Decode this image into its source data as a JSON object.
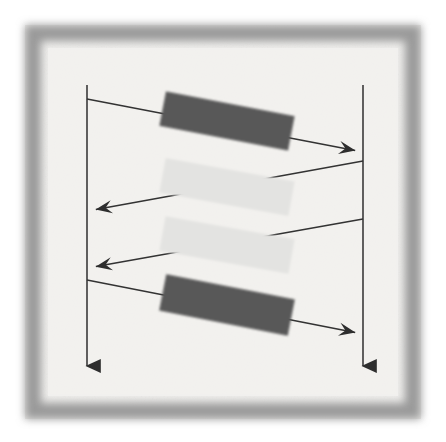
{
  "figure": {
    "kind": "uml-sequence-diagram",
    "title": "",
    "caption": "",
    "canvas": {
      "width": 446,
      "height": 442,
      "background": "#ffffff"
    },
    "frame": {
      "name": "photocopy-border",
      "x": 25,
      "y": 25,
      "width": 396,
      "height": 394,
      "thickness": 16,
      "color": "#9a9a9a",
      "blur": 7,
      "inner_fill": "#f0efed",
      "inner_texture": true
    },
    "palette": {
      "line": "#333333",
      "lifeline": "#3a3a3a",
      "bar_dark": "#585858",
      "bar_light": "#e3e3e1",
      "paper": "#f0efed",
      "page": "#ffffff"
    }
  },
  "chart_data": {
    "type": "diagram",
    "title": "",
    "xlabel": "",
    "ylabel": "",
    "lifelines": [
      {
        "id": "lifeline-left",
        "label": "",
        "x": 87,
        "y_top": 85,
        "y_bottom": 378,
        "arrowhead": "filled-triangle",
        "color": "#3a3a3a",
        "width": 1.6
      },
      {
        "id": "lifeline-right",
        "label": "",
        "x": 363,
        "y_top": 85,
        "y_bottom": 378,
        "arrowhead": "filled-triangle",
        "color": "#3a3a3a",
        "width": 1.6
      }
    ],
    "messages": [
      {
        "id": "message-1",
        "label": "",
        "direction": "left-to-right",
        "from": "lifeline-left",
        "to": "lifeline-right",
        "x1": 87,
        "y1": 99,
        "x2": 363,
        "y2": 152,
        "arrowhead": "open-line",
        "color": "#333333"
      },
      {
        "id": "message-2",
        "label": "",
        "direction": "right-to-left",
        "from": "lifeline-right",
        "to": "lifeline-left",
        "x1": 363,
        "y1": 161,
        "x2": 88,
        "y2": 211,
        "arrowhead": "open-line",
        "color": "#333333"
      },
      {
        "id": "message-3",
        "label": "",
        "direction": "right-to-left",
        "from": "lifeline-right",
        "to": "lifeline-left",
        "x1": 363,
        "y1": 219,
        "x2": 88,
        "y2": 268,
        "arrowhead": "open-line",
        "color": "#333333"
      },
      {
        "id": "message-4",
        "label": "",
        "direction": "left-to-right",
        "from": "lifeline-left",
        "to": "lifeline-right",
        "x1": 87,
        "y1": 280,
        "x2": 363,
        "y2": 334,
        "arrowhead": "open-line",
        "color": "#333333"
      }
    ],
    "label_bars": [
      {
        "id": "label-bar-1",
        "text": "",
        "obscured": true,
        "shade": "dark",
        "fill": "#585858",
        "cx": 227,
        "cy": 121,
        "width": 131,
        "height": 35,
        "rotation_deg": 10.9,
        "on_message": "message-1"
      },
      {
        "id": "label-bar-2",
        "text": "",
        "obscured": true,
        "shade": "light",
        "fill": "#e3e3e1",
        "cx": 227,
        "cy": 187,
        "width": 131,
        "height": 35,
        "rotation_deg": 10.3,
        "on_message": "message-2"
      },
      {
        "id": "label-bar-3",
        "text": "",
        "obscured": true,
        "shade": "light",
        "fill": "#e3e3e1",
        "cx": 227,
        "cy": 245,
        "width": 131,
        "height": 35,
        "rotation_deg": 10.1,
        "on_message": "message-3"
      },
      {
        "id": "label-bar-4",
        "text": "",
        "obscured": true,
        "shade": "dark",
        "fill": "#585858",
        "cx": 227,
        "cy": 305,
        "width": 131,
        "height": 37,
        "rotation_deg": 11.1,
        "on_message": "message-4"
      }
    ],
    "legend": [],
    "annotations": [],
    "grid": false
  }
}
